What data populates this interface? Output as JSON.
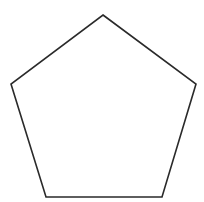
{
  "diagram": {
    "shape": "pentagon",
    "stroke_color": "#2a2a2a",
    "fill_color": "#ffffff",
    "stroke_width": 1.6,
    "points": "103,15 196,84 162,197 46,197 11,84"
  }
}
